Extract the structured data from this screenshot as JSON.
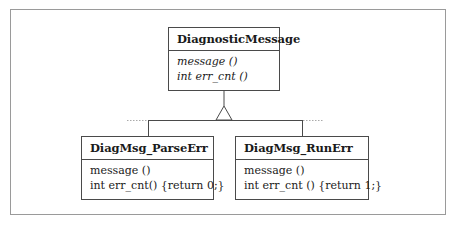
{
  "diagram": {
    "type": "uml-class-inheritance",
    "base_class": {
      "name": "DiagnosticMessage",
      "abstract": true,
      "operations": [
        "message ()",
        "int err_cnt ()"
      ]
    },
    "derived_classes": [
      {
        "name": "DiagMsg_ParseErr",
        "operations": [
          "message ()",
          "int err_cnt() {return 0;}"
        ]
      },
      {
        "name": "DiagMsg_RunErr",
        "operations": [
          "message ()",
          "int err_cnt () {return 1;}"
        ]
      }
    ],
    "relationship": "generalization",
    "colors": {
      "frame": "#9a9a9a",
      "box_border": "#4a4a4a",
      "text": "#1a1a1a",
      "dotted": "#aaaaaa"
    }
  }
}
